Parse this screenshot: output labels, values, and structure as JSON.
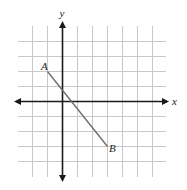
{
  "chart_data": {
    "type": "diagram",
    "title": "",
    "xlabel": "x",
    "ylabel": "y",
    "grid": true,
    "grid_x_range": [
      -2,
      6
    ],
    "grid_y_range": [
      -4,
      4
    ],
    "points": [
      {
        "label": "A",
        "x": -1,
        "y": 2
      },
      {
        "label": "B",
        "x": 3,
        "y": -3
      }
    ],
    "segments": [
      {
        "from": "A",
        "to": "B"
      }
    ]
  },
  "labels": {
    "x_axis": "x",
    "y_axis": "y",
    "point_a": "A",
    "point_b": "B"
  },
  "colors": {
    "grid": "#c8c8c8",
    "axis": "#1a1a1a",
    "segment": "#6e6e6e"
  }
}
